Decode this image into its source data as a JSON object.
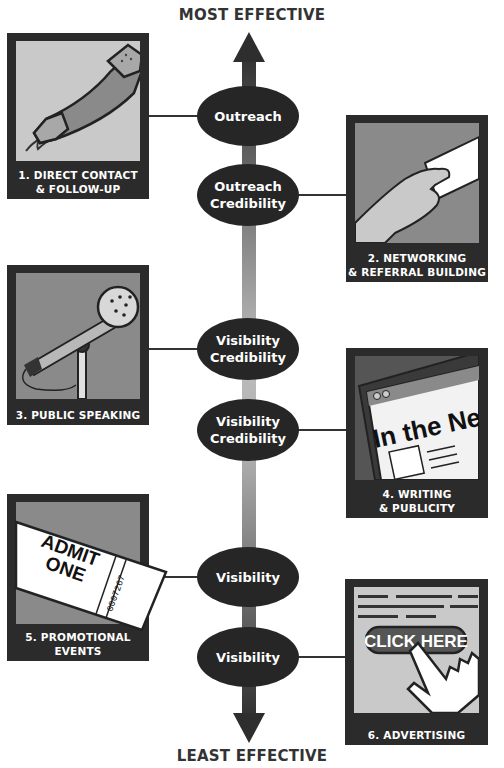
{
  "title_top": "MOST EFFECTIVE",
  "title_bottom": "LEAST EFFECTIVE",
  "colors": {
    "panel_frame": "#2b2b2b",
    "ellipse_fill": "#262626",
    "axis_dark": "#3a3a3a",
    "axis_light": "#b8b8b8",
    "art_light": "#c8c8c8",
    "art_mid": "#8a8a8a"
  },
  "ellipses": [
    {
      "line1": "Outreach",
      "line2": ""
    },
    {
      "line1": "Outreach",
      "line2": "Credibility"
    },
    {
      "line1": "Visibility",
      "line2": "Credibility"
    },
    {
      "line1": "Visibility",
      "line2": "Credibility"
    },
    {
      "line1": "Visibility",
      "line2": ""
    },
    {
      "line1": "Visibility",
      "line2": ""
    }
  ],
  "panels": [
    {
      "line1": "1. DIRECT CONTACT",
      "line2": "& FOLLOW-UP",
      "icon": "telephone-handset"
    },
    {
      "line1": "2. NETWORKING",
      "line2": "& REFERRAL BUILDING",
      "icon": "hand-with-business-card"
    },
    {
      "line1": "3. PUBLIC SPEAKING",
      "line2": "",
      "icon": "microphone"
    },
    {
      "line1": "4. WRITING",
      "line2": "& PUBLICITY",
      "icon": "news-tablet"
    },
    {
      "line1": "5. PROMOTIONAL",
      "line2": "EVENTS",
      "icon": "admission-ticket"
    },
    {
      "line1": "6. ADVERTISING",
      "line2": "",
      "icon": "click-here-cursor"
    }
  ],
  "art_text": {
    "news_headline": "In the News",
    "ticket_line1": "ADMIT",
    "ticket_line2": "ONE",
    "ticket_number": "0007267",
    "ad_button": "CLICK HERE"
  }
}
